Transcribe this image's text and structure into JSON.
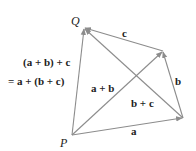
{
  "diagram": {
    "vertices": {
      "P": {
        "label": "P",
        "x": 72,
        "y": 135
      },
      "Q": {
        "label": "Q",
        "x": 84,
        "y": 28
      },
      "R": {
        "label": "",
        "x": 183,
        "y": 118
      },
      "S": {
        "label": "",
        "x": 163,
        "y": 51
      }
    },
    "edges": [
      {
        "from": "P",
        "to": "R",
        "label": "a"
      },
      {
        "from": "R",
        "to": "S",
        "label": "b"
      },
      {
        "from": "S",
        "to": "Q",
        "label": "c"
      },
      {
        "from": "P",
        "to": "S",
        "label": "a + b"
      },
      {
        "from": "R",
        "to": "Q",
        "label": "b + c"
      },
      {
        "from": "P",
        "to": "Q",
        "label": ""
      }
    ],
    "labels": {
      "a": "a",
      "b": "b",
      "c": "c",
      "a_plus_b": "a + b",
      "b_plus_c": "b + c",
      "eq_line1": "(a + b) + c",
      "eq_line2": "= a + (b + c)",
      "P": "P",
      "Q": "Q"
    },
    "colors": {
      "edge": "#8c8c8c",
      "text": "#222222"
    }
  }
}
